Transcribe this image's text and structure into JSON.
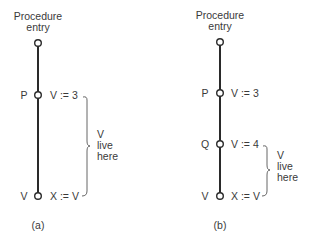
{
  "diagrams": [
    {
      "id": "a",
      "caption": "(a)",
      "entry_label_line1": "Procedure",
      "entry_label_line2": "entry",
      "nodes": [
        {
          "label": "P",
          "statement": "V := 3"
        },
        {
          "label": "V",
          "statement": "X := V"
        }
      ],
      "live_range_label": [
        "V",
        "live",
        "here"
      ]
    },
    {
      "id": "b",
      "caption": "(b)",
      "entry_label_line1": "Procedure",
      "entry_label_line2": "entry",
      "nodes": [
        {
          "label": "P",
          "statement": "V := 3"
        },
        {
          "label": "Q",
          "statement": "V := 4"
        },
        {
          "label": "V",
          "statement": "X := V"
        }
      ],
      "live_range_label": [
        "V",
        "live",
        "here"
      ]
    }
  ]
}
